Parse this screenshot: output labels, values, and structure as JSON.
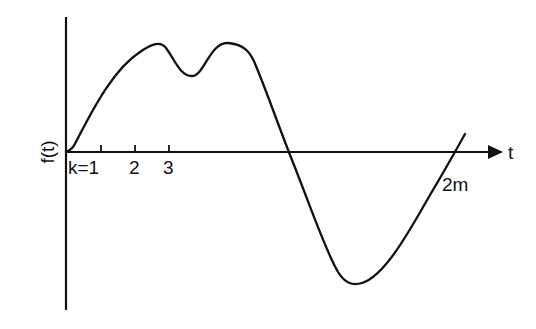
{
  "diagram": {
    "type": "function-plot",
    "y_axis_label": "f(t)",
    "x_axis_label": "t",
    "tick_labels": [
      "k=1",
      "2",
      "3"
    ],
    "end_label": "2m",
    "colors": {
      "ink": "#111111",
      "background": "#ffffff"
    },
    "curve_description": "Curve starts at origin, rises to a peak, dips, rises to a second peak, falls below the axis to a minimum, then rises crossing the axis at 2m"
  }
}
